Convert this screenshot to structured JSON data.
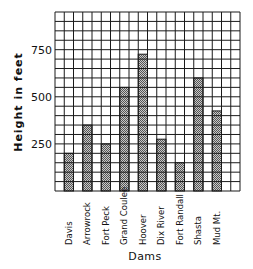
{
  "chart_data": {
    "type": "bar",
    "title": "",
    "xlabel": "Dams",
    "ylabel": "Height in feet",
    "categories": [
      "Davis",
      "Arrowrock",
      "Fort Peck",
      "Grand Coulee",
      "Hoover",
      "Dix River",
      "Fort Randall",
      "Shasta",
      "Mud Mt."
    ],
    "values": [
      200,
      350,
      250,
      550,
      726,
      275,
      150,
      600,
      425
    ],
    "ylim": [
      0,
      950
    ],
    "yticks": [
      250,
      500,
      750
    ],
    "ytick_labels": [
      "250",
      "500",
      "750"
    ],
    "grid": true,
    "grid_rows": 19,
    "grid_cols": 20,
    "grid_step": 50,
    "bar_fill": "crosshatch",
    "legend": null
  },
  "colors": {
    "grid": "#1a1a1a",
    "bar_fill": "#6e6e6e",
    "bar_light": "#c8c8c8",
    "text": "#111111",
    "background": "#ffffff"
  }
}
